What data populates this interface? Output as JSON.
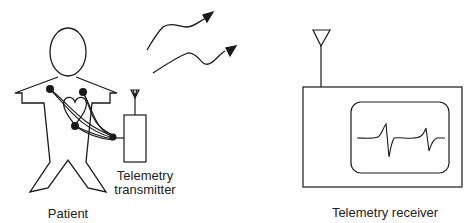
{
  "diagram": {
    "type": "wireless ECG telemetry system",
    "labels": {
      "patient": "Patient",
      "transmitter_line1": "Telemetry",
      "transmitter_line2": "transmitter",
      "receiver": "Telemetry receiver"
    },
    "components": [
      {
        "id": "patient",
        "name": "Patient figure with heart and electrodes"
      },
      {
        "id": "transmitter",
        "name": "Telemetry transmitter with antenna"
      },
      {
        "id": "signal",
        "name": "Wireless signal arrows"
      },
      {
        "id": "receiver",
        "name": "Telemetry receiver with antenna and ECG display"
      }
    ],
    "electrode_count": 3,
    "ecg_beats_displayed": 2,
    "colors": {
      "stroke": "#1a1a1a",
      "background": "#ffffff"
    }
  }
}
